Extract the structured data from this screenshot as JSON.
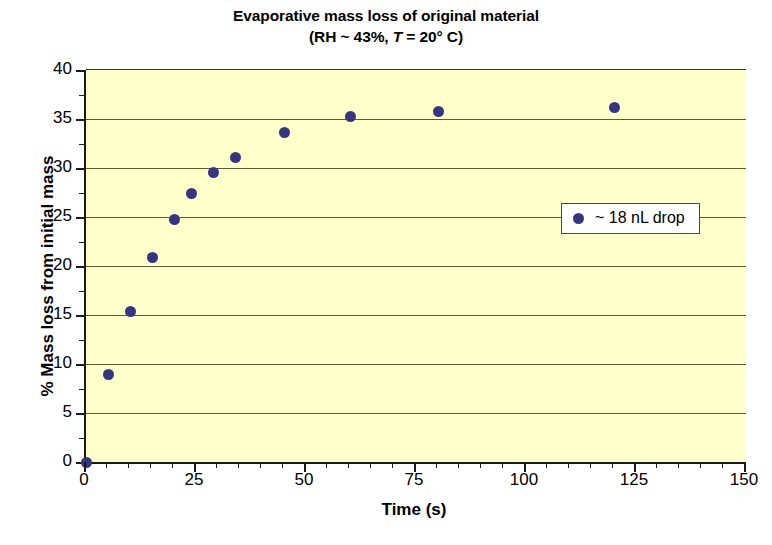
{
  "chart_data": {
    "type": "scatter",
    "title": "Evaporative mass loss of original material",
    "subtitle_prefix": "(RH ~ 43%, ",
    "subtitle_italic": "T",
    "subtitle_suffix": " = 20° C)",
    "xlabel": "Time (s)",
    "ylabel": "% Mass loss from initial mass",
    "xlim": [
      0,
      150
    ],
    "ylim": [
      0,
      40
    ],
    "xticks": [
      0,
      25,
      50,
      75,
      100,
      125,
      150
    ],
    "yticks": [
      0,
      5,
      10,
      15,
      20,
      25,
      30,
      35,
      40
    ],
    "x_minor_step": 5,
    "grid": "horizontal",
    "legend_position": "center-right",
    "plot_background": "#ffffcc",
    "marker_color": "#36367f",
    "gridline_color": "#5c5c33",
    "axis_color": "#1a1a1a",
    "series": [
      {
        "name": "~ 18 nL drop",
        "points": [
          {
            "x": 0,
            "y": 0.0
          },
          {
            "x": 5,
            "y": 8.9
          },
          {
            "x": 10,
            "y": 15.4
          },
          {
            "x": 15,
            "y": 20.9
          },
          {
            "x": 20,
            "y": 24.7
          },
          {
            "x": 24,
            "y": 27.4
          },
          {
            "x": 29,
            "y": 29.5
          },
          {
            "x": 34,
            "y": 31.1
          },
          {
            "x": 45,
            "y": 33.6
          },
          {
            "x": 60,
            "y": 35.3
          },
          {
            "x": 80,
            "y": 35.8
          },
          {
            "x": 120,
            "y": 36.2
          }
        ]
      }
    ]
  },
  "legend": {
    "entries": [
      {
        "label": "~ 18 nL drop",
        "color": "#36367f",
        "marker": "circle"
      }
    ]
  }
}
